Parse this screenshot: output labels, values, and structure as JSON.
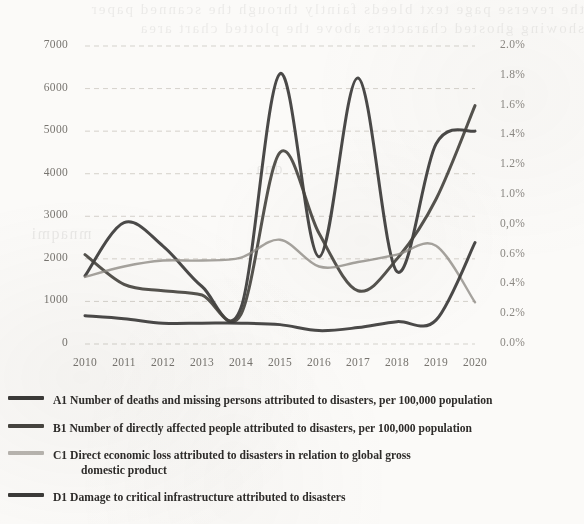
{
  "chart_data": {
    "type": "line",
    "title": "",
    "xlabel": "",
    "ylabel": "",
    "categories": [
      "2010",
      "2011",
      "2012",
      "2013",
      "2014",
      "2015",
      "2016",
      "2017",
      "2018",
      "2019",
      "2020"
    ],
    "x_tick_labels": [
      "2010",
      "2011",
      "2012",
      "2013",
      "2014",
      "2015",
      "2016",
      "2017",
      "2018",
      "2019",
      "2020"
    ],
    "left_axis": {
      "ylabel": "",
      "ylim": [
        0,
        7000
      ],
      "tick_labels": [
        "7000",
        "6000",
        "5000",
        "4000",
        "3000",
        "2000",
        "1000",
        "0"
      ],
      "tick_values": [
        7000,
        6000,
        5000,
        4000,
        3000,
        2000,
        1000,
        0
      ]
    },
    "right_axis": {
      "ylabel": "",
      "ylim": [
        0,
        2.0
      ],
      "tick_labels": [
        "2.0%",
        "1.8%",
        "1.6%",
        "1.4%",
        "1.2%",
        "1.0%",
        "0,0%",
        "0.6%",
        "0.4%",
        "0.2%",
        "0.0%"
      ],
      "tick_values": [
        2.0,
        1.8,
        1.6,
        1.4,
        1.2,
        1.0,
        0.8,
        0.6,
        0.4,
        0.2,
        0.0
      ]
    },
    "grid": true,
    "legend_position": "bottom",
    "series": [
      {
        "key": "A1",
        "name": "A1 Number of deaths and missing persons attributed to disasters, per 100,000 population",
        "axis": "left",
        "color": "#3b3a38",
        "values": [
          1600,
          2850,
          2300,
          1350,
          850,
          6350,
          2050,
          6250,
          1700,
          4700,
          5000
        ]
      },
      {
        "key": "B1",
        "name": "B1 Number of directly affected people attributed to disasters, per 100,000 population",
        "axis": "left",
        "color": "#46443f",
        "values": [
          2100,
          1400,
          1250,
          1150,
          700,
          4500,
          2600,
          1250,
          2000,
          3400,
          5600
        ]
      },
      {
        "key": "C1",
        "name": "C1 Direct economic loss attributed to disasters in relation to global gross domestic product",
        "axis": "right",
        "color": "#8e8b84",
        "values": [
          0.45,
          0.52,
          0.56,
          0.56,
          0.58,
          0.7,
          0.52,
          0.55,
          0.6,
          0.66,
          0.28
        ]
      },
      {
        "key": "D1",
        "name": "D1 Damage to critical infrastructure attributed to disasters",
        "axis": "right",
        "color": "#3b3a38",
        "values": [
          0.19,
          0.17,
          0.14,
          0.14,
          0.14,
          0.13,
          0.09,
          0.11,
          0.15,
          0.16,
          0.68
        ]
      }
    ]
  },
  "legend": {
    "items": [
      {
        "marker": "line-swatch-a1",
        "label": "A1 Number of deaths and missing persons attributed to disasters, per 100,000 population",
        "label_cont": ""
      },
      {
        "marker": "line-swatch-b1",
        "label": "B1 Number of directly affected people attributed to disasters, per 100,000 population",
        "label_cont": ""
      },
      {
        "marker": "line-swatch-c1",
        "label": "C1 Direct economic loss attributed to disasters in relation to global gross",
        "label_cont": "domestic product"
      },
      {
        "marker": "line-swatch-d1",
        "label": "D1 Damage to critical infrastructure attributed to disasters",
        "label_cont": ""
      }
    ]
  },
  "page": {
    "bleed_text_line1": "the reverse page text bleeds faintly through the scanned paper",
    "bleed_text_line2": "showing ghosted characters above the plotted chart area"
  }
}
